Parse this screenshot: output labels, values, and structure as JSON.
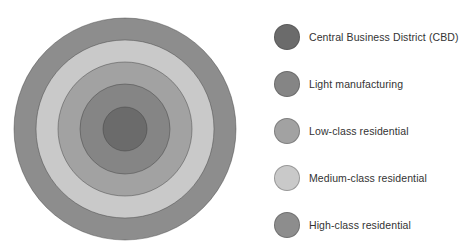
{
  "diagram": {
    "type": "concentric-zone-model",
    "center": {
      "x": 125,
      "y": 129
    },
    "zones": [
      {
        "key": "high_class",
        "label": "High-class residential",
        "color": "#8d8d8d",
        "radius": 111
      },
      {
        "key": "medium_class",
        "label": "Medium-class residential",
        "color": "#c9c9c9",
        "radius": 89
      },
      {
        "key": "low_class",
        "label": "Low-class residential",
        "color": "#a2a2a2",
        "radius": 67
      },
      {
        "key": "light_manufacturing",
        "label": "Light manufacturing",
        "color": "#858585",
        "radius": 45
      },
      {
        "key": "cbd",
        "label": "Central Business District (CBD)",
        "color": "#6b6b6b",
        "radius": 22
      }
    ]
  },
  "legend": {
    "items": [
      {
        "label": "Central Business District (CBD)",
        "color": "#6b6b6b",
        "y": 37
      },
      {
        "label": "Light manufacturing",
        "color": "#858585",
        "y": 84
      },
      {
        "label": "Low-class residential",
        "color": "#a2a2a2",
        "y": 131
      },
      {
        "label": "Medium-class residential",
        "color": "#c9c9c9",
        "y": 178
      },
      {
        "label": "High-class residential",
        "color": "#8d8d8d",
        "y": 225
      }
    ]
  }
}
